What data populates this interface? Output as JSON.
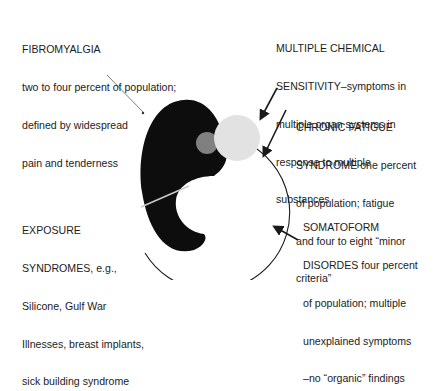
{
  "labels": {
    "fibromyalgia": {
      "lines": [
        "FIBROMYALGIA",
        "two to four percent of population;",
        "defined by widespread",
        "pain and tenderness"
      ]
    },
    "multiple_chemical_sensitivity": {
      "lines": [
        "MULTIPLE CHEMICAL",
        "SENSITIVITY–symptoms in",
        "multiple organ systems in",
        "response to multiple",
        "substances"
      ]
    },
    "chronic_fatigue_syndrome": {
      "lines": [
        "CHRONIC FATIGUE",
        "SYNDROME one percent",
        "of population; fatigue",
        "and four to eight “minor",
        "criteria”"
      ]
    },
    "exposure_syndromes": {
      "lines": [
        "EXPOSURE",
        "SYNDROMES, e.g.,",
        "Silicone, Gulf War",
        "Illnesses, breast implants,",
        "sick building syndrome"
      ]
    },
    "somatoform_disorders": {
      "lines": [
        "SOMATOFORM",
        "DISORDES four percent",
        "of population; multiple",
        "unexplained symptoms",
        "–no “organic” findings"
      ]
    }
  },
  "colors": {
    "fibromyalgia_fill": "#0d0d0d",
    "chemical_sensitivity_fill": "#808080",
    "chronic_fatigue_fill": "#e2e2e2",
    "outline": "#1a1a1a",
    "exposure_line": "#c8c8c8"
  }
}
